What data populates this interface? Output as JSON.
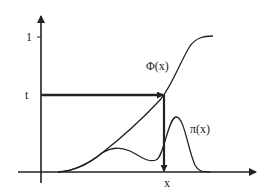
{
  "diagram": {
    "title": "",
    "labels": {
      "y_tick_one": "1",
      "y_threshold": "t",
      "x_point": "x",
      "cdf_label": "Φ(x)",
      "pdf_label": "π(x)"
    },
    "curves": [
      {
        "name": "cdf",
        "label": "Φ(x)",
        "description": "cumulative distribution, rising from 0 to 1"
      },
      {
        "name": "pdf",
        "label": "π(x)",
        "description": "bimodal density with small left bump and taller right peak"
      }
    ],
    "arrows": [
      {
        "name": "threshold-arrow",
        "from": "t on y-axis",
        "to": "Φ(x) curve",
        "direction": "right"
      },
      {
        "name": "inverse-arrow",
        "from": "Φ(x) curve",
        "to": "x on x-axis",
        "direction": "down"
      }
    ],
    "colors": {
      "stroke": "#222222",
      "background": "#ffffff"
    }
  }
}
